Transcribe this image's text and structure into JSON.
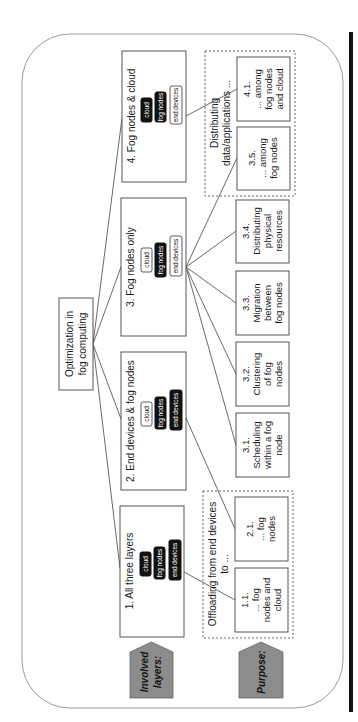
{
  "root": {
    "line1": "Optimization in",
    "line2": "fog computing"
  },
  "labels": {
    "involved_layers": {
      "line1": "Involved",
      "line2": "layers:"
    },
    "purpose": "Purpose:"
  },
  "layer_names": {
    "cloud": "cloud",
    "fog": "fog nodes",
    "end": "end devices"
  },
  "categories": [
    {
      "id": "1",
      "title": "1. All three layers",
      "cloud": "active",
      "fog": "active",
      "end": "active"
    },
    {
      "id": "2",
      "title": "2. End devices & fog nodes",
      "cloud": "inactive",
      "fog": "active",
      "end": "active"
    },
    {
      "id": "3",
      "title": "3. Fog nodes only",
      "cloud": "inactive",
      "fog": "active",
      "end": "inactive"
    },
    {
      "id": "4",
      "title": "4. Fog nodes & cloud",
      "cloud": "active",
      "fog": "active",
      "end": "inactive"
    }
  ],
  "groups": {
    "offloading": {
      "line1": "Offloading from end devices",
      "line2": "to ..."
    },
    "distributing": {
      "line1": "Distributing",
      "line2": "data/applications ..."
    }
  },
  "purposes": {
    "p11": {
      "num": "1.1.",
      "l1": "... fog",
      "l2": "nodes and",
      "l3": "cloud"
    },
    "p21": {
      "num": "2.1.",
      "l1": "... fog",
      "l2": "nodes"
    },
    "p31": {
      "num": "3.1.",
      "l1": "Scheduling",
      "l2": "within a fog",
      "l3": "node"
    },
    "p32": {
      "num": "3.2.",
      "l1": "Clustering",
      "l2": "of fog",
      "l3": "nodes"
    },
    "p33": {
      "num": "3.3.",
      "l1": "Migration",
      "l2": "between",
      "l3": "fog nodes"
    },
    "p34": {
      "num": "3.4.",
      "l1": "Distributing",
      "l2": "physical",
      "l3": "resources"
    },
    "p35": {
      "num": "3.5.",
      "l1": "... among",
      "l2": "fog nodes"
    },
    "p41": {
      "num": "4.1.",
      "l1": "... among",
      "l2": "fog nodes",
      "l3": "and cloud"
    }
  },
  "colors": {
    "tag_fill": "#8c8c8c",
    "pill_dark": "#111111",
    "frame": "#999999"
  }
}
